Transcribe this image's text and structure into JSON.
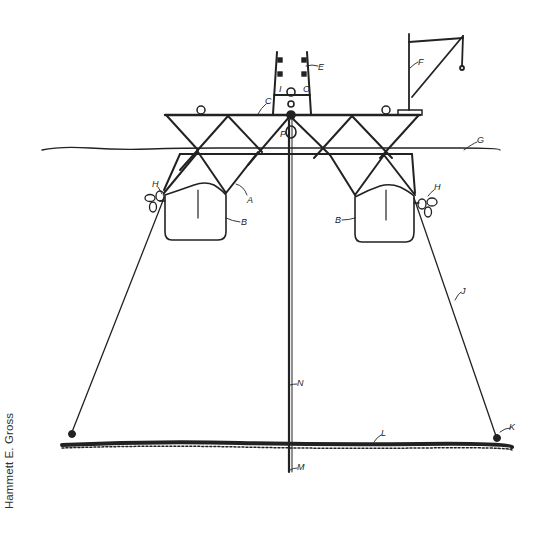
{
  "credit": "Hammett E. Gross",
  "figure": {
    "labels": {
      "A": "A",
      "B": "B",
      "C": "C",
      "E": "E",
      "F": "F",
      "G": "G",
      "H": "H",
      "I": "I",
      "J": "J",
      "K": "K",
      "L": "L",
      "M": "M",
      "N": "N",
      "O": "O",
      "P": "P"
    }
  },
  "colors": {
    "ink": "#222222",
    "background": "#ffffff"
  }
}
